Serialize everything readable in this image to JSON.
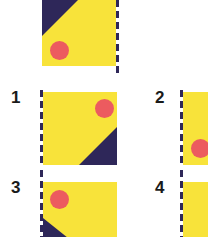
{
  "colors": {
    "yellow": "#f8e33a",
    "navy": "#2e2759",
    "red": "#ec5b5f"
  },
  "figure": {
    "reference": {
      "shape": "yellow square",
      "triangle_corner": "top-left",
      "dot_position": "bottom-left",
      "dashed_edge": "right"
    },
    "options": [
      {
        "label": "1",
        "triangle_corner": "bottom-right",
        "dot_position": "top-right",
        "dashed_edge": "left"
      },
      {
        "label": "2",
        "triangle_corner": "unknown (cropped)",
        "dot_position": "bottom-left",
        "dashed_edge": "left"
      },
      {
        "label": "3",
        "triangle_corner": "bottom-left",
        "dot_position": "top-left",
        "dashed_edge": "left"
      },
      {
        "label": "4",
        "triangle_corner": "unknown (cropped)",
        "dot_position": "unknown (cropped)",
        "dashed_edge": "left"
      }
    ]
  }
}
